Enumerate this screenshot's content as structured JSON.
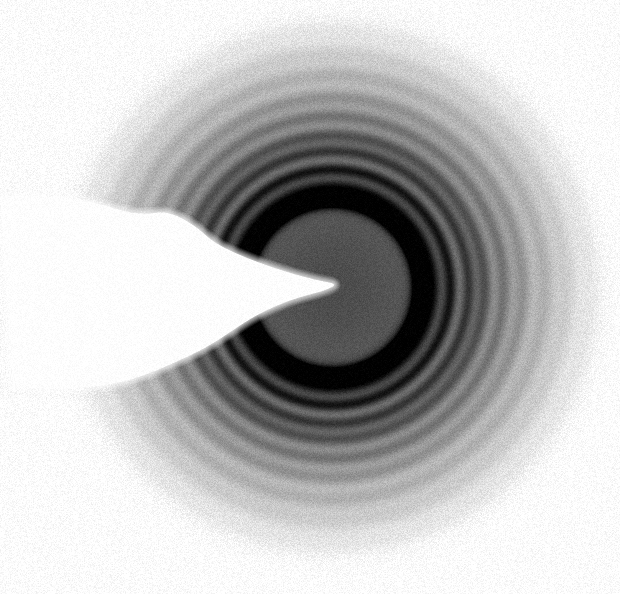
{
  "image": {
    "kind": "electron-diffraction-photograph",
    "width": 620,
    "height": 594,
    "background_color": "#ffffff",
    "medium": "scanned photographic film",
    "grain_amount": 0.085,
    "grain_scale": 1
  },
  "pattern": {
    "center_x": 332,
    "center_y": 287,
    "max_radius": 300,
    "global_falloff_start": 215,
    "global_falloff_end": 300,
    "central_disk_radius": 88,
    "central_disk_darkness": 0.7,
    "halo_color": "#2b2b2b"
  },
  "chart_data": {
    "type": "radial-profile",
    "xlabel": "radius from beam centre (px)",
    "ylabel": "optical density (0 = white, 1 = black)",
    "xlim": [
      0,
      300
    ],
    "ylim": [
      0,
      1
    ],
    "grid": false,
    "legend": "none",
    "note": "Concentric diffraction maxima; intensity falls off with radius.",
    "rings": [
      {
        "name": "central-disk-core",
        "radius": 0,
        "width": 72,
        "intensity": 0.7
      },
      {
        "name": "central-disk-rim",
        "radius": 88,
        "width": 9,
        "intensity": 0.8
      },
      {
        "name": "ring-1",
        "radius": 101,
        "width": 9,
        "intensity": 0.52
      },
      {
        "name": "ring-2",
        "radius": 118,
        "width": 8,
        "intensity": 0.56
      },
      {
        "name": "ring-3",
        "radius": 136,
        "width": 8,
        "intensity": 0.46
      },
      {
        "name": "ring-4",
        "radius": 152,
        "width": 9,
        "intensity": 0.4
      },
      {
        "name": "ring-5",
        "radius": 171,
        "width": 9,
        "intensity": 0.31
      },
      {
        "name": "ring-6",
        "radius": 190,
        "width": 10,
        "intensity": 0.24
      },
      {
        "name": "ring-7",
        "radius": 212,
        "width": 11,
        "intensity": 0.17
      },
      {
        "name": "ring-8",
        "radius": 234,
        "width": 12,
        "intensity": 0.11
      },
      {
        "name": "ring-9",
        "radius": 258,
        "width": 13,
        "intensity": 0.07
      }
    ],
    "background_envelope": [
      {
        "radius": 0,
        "density": 0.7
      },
      {
        "radius": 80,
        "density": 0.66
      },
      {
        "radius": 95,
        "density": 0.4
      },
      {
        "radius": 130,
        "density": 0.34
      },
      {
        "radius": 170,
        "density": 0.24
      },
      {
        "radius": 210,
        "density": 0.15
      },
      {
        "radius": 250,
        "density": 0.07
      },
      {
        "radius": 300,
        "density": 0.01
      }
    ]
  },
  "beam_stop": {
    "name": "beam-stop-shadow",
    "description": "White unexposed shadow of the beam stop arm entering from the left edge and tapering to a point at the pattern centre",
    "color": "#ffffff",
    "tip_x": 338,
    "tip_y": 284,
    "edge_softness": 3,
    "outline": [
      [
        0,
        196
      ],
      [
        26,
        196
      ],
      [
        58,
        197
      ],
      [
        86,
        200
      ],
      [
        112,
        208
      ],
      [
        140,
        215
      ],
      [
        168,
        211
      ],
      [
        196,
        226
      ],
      [
        214,
        243
      ],
      [
        246,
        258
      ],
      [
        286,
        272
      ],
      [
        320,
        281
      ],
      [
        338,
        284
      ],
      [
        324,
        291
      ],
      [
        292,
        299
      ],
      [
        256,
        315
      ],
      [
        232,
        331
      ],
      [
        206,
        348
      ],
      [
        176,
        362
      ],
      [
        148,
        374
      ],
      [
        120,
        383
      ],
      [
        92,
        387
      ],
      [
        56,
        388
      ],
      [
        26,
        388
      ],
      [
        0,
        387
      ]
    ]
  }
}
